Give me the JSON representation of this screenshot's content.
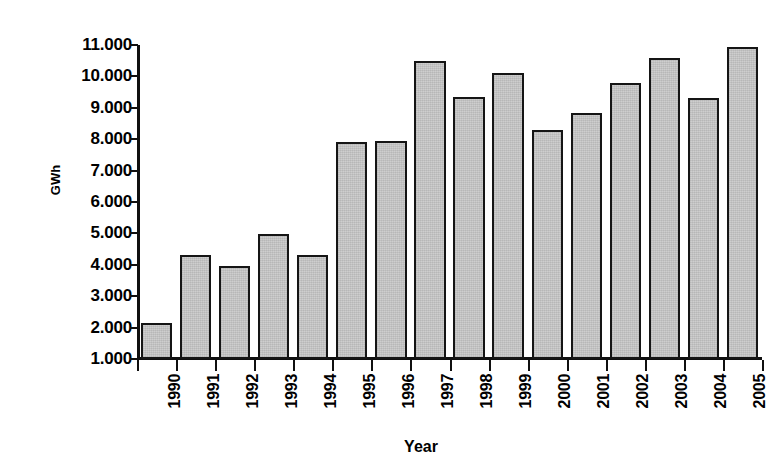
{
  "chart_data": {
    "type": "bar",
    "title": "",
    "xlabel": "Year",
    "ylabel": "GWh",
    "categories": [
      "1990",
      "1991",
      "1992",
      "1993",
      "1994",
      "1995",
      "1996",
      "1997",
      "1998",
      "1999",
      "2000",
      "2001",
      "2002",
      "2003",
      "2004",
      "2005"
    ],
    "values": [
      2150,
      4300,
      3950,
      4980,
      4300,
      7900,
      7930,
      10500,
      9350,
      10100,
      8300,
      8820,
      9800,
      10600,
      9300,
      10930
    ],
    "ytick_labels": [
      "11.000",
      "10.000",
      "9.000",
      "8.000",
      "7.000",
      "6.000",
      "5.000",
      "4.000",
      "3.000",
      "2.000",
      "1.000"
    ],
    "ytick_values": [
      11000,
      10000,
      9000,
      8000,
      7000,
      6000,
      5000,
      4000,
      3000,
      2000,
      1000
    ],
    "ylim": [
      1000,
      11000
    ],
    "grid": false,
    "legend": null,
    "bar_fill_color": "#c9c9c9",
    "bar_edge_color": "#151515",
    "axis_color": "#101010"
  }
}
